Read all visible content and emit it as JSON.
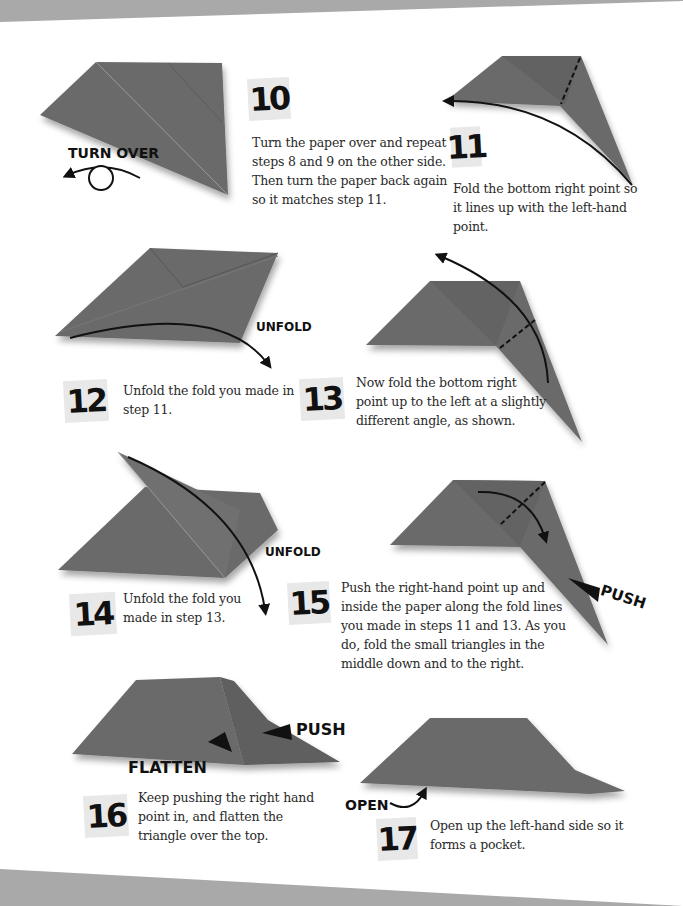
{
  "page": {
    "colors": {
      "paper": "#6b6b6b",
      "paper_dark": "#5a5a5a",
      "band": "#a9a9a9",
      "badge_bg": "#e8e8e8",
      "text": "#2a2a2a"
    }
  },
  "steps": [
    {
      "number": "10",
      "text": [
        "Turn the paper over and repeat",
        "steps 8 and 9 on the other side.",
        "Then turn the paper back again",
        "so it matches step 11."
      ],
      "action_label": "TURN OVER"
    },
    {
      "number": "11",
      "text": [
        "Fold the bottom right point so",
        "it lines up with the left-hand",
        "point."
      ]
    },
    {
      "number": "12",
      "text": [
        "Unfold the fold you made in",
        "step 11."
      ],
      "action_label": "UNFOLD"
    },
    {
      "number": "13",
      "text": [
        "Now fold the bottom right",
        "point up to the left at a slightly",
        "different angle, as shown."
      ]
    },
    {
      "number": "14",
      "text": [
        "Unfold the fold you",
        "made in step 13."
      ],
      "action_label": "UNFOLD"
    },
    {
      "number": "15",
      "text": [
        "Push the right-hand point up and",
        "inside the paper along the fold lines",
        "you made in steps 11 and 13. As you",
        "do, fold the small triangles in the",
        "middle down and to the right."
      ],
      "action_label": "PUSH"
    },
    {
      "number": "16",
      "text": [
        "Keep pushing the right hand",
        "point in, and flatten the",
        "triangle over the top."
      ],
      "action_labels": [
        "PUSH",
        "FLATTEN"
      ]
    },
    {
      "number": "17",
      "text": [
        "Open up the left-hand side so it",
        "forms a pocket."
      ],
      "action_label": "OPEN"
    }
  ]
}
